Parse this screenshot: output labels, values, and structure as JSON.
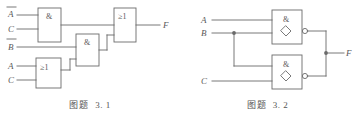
{
  "page": {
    "background": "#ffffff",
    "ink": "#5a5a5a"
  },
  "figures": [
    {
      "id": "figure-1",
      "caption_label": "图题",
      "caption_number": "3. 1",
      "inputs": [
        {
          "name": "A-bar",
          "text": "A",
          "overbar": true
        },
        {
          "name": "C-upper",
          "text": "C",
          "overbar": false
        },
        {
          "name": "B-bar",
          "text": "B",
          "overbar": true
        },
        {
          "name": "A-lower",
          "text": "A",
          "overbar": false
        },
        {
          "name": "C-lower",
          "text": "C",
          "overbar": false
        }
      ],
      "gates": [
        {
          "name": "and-gate-top",
          "symbol": "&"
        },
        {
          "name": "and-gate-middle",
          "symbol": "&"
        },
        {
          "name": "or-gate-bottom",
          "symbol": "≥1"
        },
        {
          "name": "or-gate-output",
          "symbol": "≥1"
        }
      ],
      "output": {
        "name": "output-F",
        "text": "F"
      }
    },
    {
      "id": "figure-2",
      "caption_label": "图题",
      "caption_number": "3. 2",
      "inputs": [
        {
          "name": "A",
          "text": "A",
          "overbar": false
        },
        {
          "name": "B",
          "text": "B",
          "overbar": false
        },
        {
          "name": "C",
          "text": "C",
          "overbar": false
        }
      ],
      "gates": [
        {
          "name": "nand-gate-open-collector-upper",
          "symbol": "&",
          "modifier": "open-collector-diamond",
          "inverted_output": true
        },
        {
          "name": "nand-gate-open-collector-lower",
          "symbol": "&",
          "modifier": "open-collector-diamond",
          "inverted_output": true
        }
      ],
      "output": {
        "name": "output-F",
        "text": "F"
      }
    }
  ]
}
